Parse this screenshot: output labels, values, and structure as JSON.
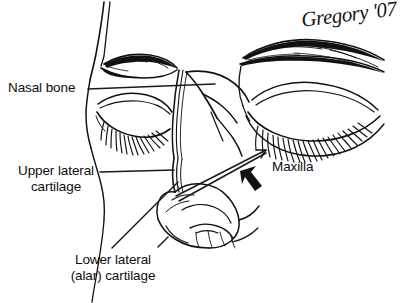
{
  "figure": {
    "type": "line-art anatomical illustration",
    "background_color": "#ffffff",
    "ink_color": "#111111",
    "width": 407,
    "height": 303
  },
  "signature": {
    "text": "Gregory '07",
    "artist": "Gregory",
    "year": "'07"
  },
  "labels": {
    "nasal_bone": "Nasal bone",
    "upper_lateral_cartilage": "Upper lateral\ncartilage",
    "lower_lateral_cartilage": "Lower lateral\n(alar) cartilage",
    "maxilla": "Maxilla"
  },
  "annotations": [
    {
      "name": "nasal-bone",
      "text": "Nasal bone",
      "leader": "horizontal line from label to nasal dorsum",
      "target": "nasal bone / bony dorsum"
    },
    {
      "name": "upper-lateral-cartilage",
      "text": "Upper lateral cartilage",
      "leader": "horizontal line from label to mid-dorsum",
      "target": "upper lateral cartilage"
    },
    {
      "name": "lower-lateral-cartilage",
      "text": "Lower lateral (alar) cartilage",
      "leader": "diagonal line from label up-right to nasal tip",
      "target": "lower lateral (alar) cartilage"
    },
    {
      "name": "maxilla",
      "text": "Maxilla",
      "leader": "long double line with arrowhead pointing up-right",
      "target": "maxilla / nasomaxillary region"
    }
  ],
  "markers": {
    "solid_arrow": "bold filled arrow pointing up-left toward the nasofacial junction",
    "thin_arrowhead": "open arrowhead at the end of the maxilla leader line"
  },
  "anatomy_features": [
    "near eyebrow",
    "near closed eye with lashes",
    "far eyebrow",
    "far closed eye with lashes",
    "nasal dorsum",
    "nasal tip",
    "ala and nostril rim",
    "cheek contour"
  ]
}
